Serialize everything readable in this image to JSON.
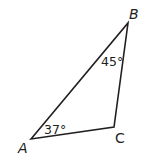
{
  "figure": {
    "type": "triangle",
    "vertices": [
      {
        "name": "A",
        "x": 31,
        "y": 139
      },
      {
        "name": "B",
        "x": 128,
        "y": 23
      },
      {
        "name": "C",
        "x": 114,
        "y": 127
      }
    ],
    "labels": {
      "A": "A",
      "B": "B",
      "C": "C"
    },
    "angles": {
      "A": "37°",
      "B": "45°"
    },
    "stroke_color": "#231f20"
  }
}
